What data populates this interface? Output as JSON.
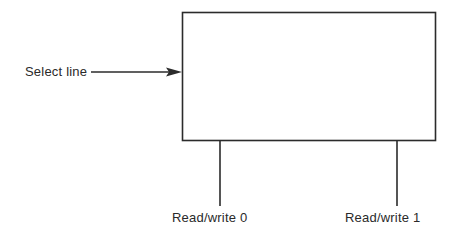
{
  "diagram": {
    "box": {
      "x": 182,
      "y": 12,
      "width": 253,
      "height": 128,
      "stroke": "#2b2b2b"
    },
    "input": {
      "label": "Select line",
      "arrow": {
        "x1": 91,
        "x2": 182,
        "y": 72
      }
    },
    "outputs": [
      {
        "label": "Read/write 0",
        "x": 220
      },
      {
        "label": "Read/write 1",
        "x": 397
      }
    ]
  }
}
